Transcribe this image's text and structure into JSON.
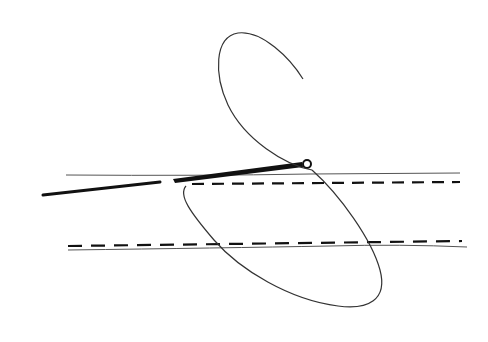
{
  "diagram": {
    "colors": {
      "background": "#ffffff",
      "ink": "#111111",
      "thin_line": "#555555"
    },
    "elements": [
      {
        "name": "upper-tissue-edge",
        "type": "thin-line"
      },
      {
        "name": "upper-dashed-line",
        "type": "dashed-line"
      },
      {
        "name": "lower-dashed-line",
        "type": "dashed-line"
      },
      {
        "name": "lower-tissue-edge",
        "type": "thin-line"
      },
      {
        "name": "needle",
        "type": "bold-line-with-eye"
      },
      {
        "name": "thread-tail",
        "type": "bold-line"
      },
      {
        "name": "suture-loop",
        "type": "curve"
      }
    ]
  }
}
